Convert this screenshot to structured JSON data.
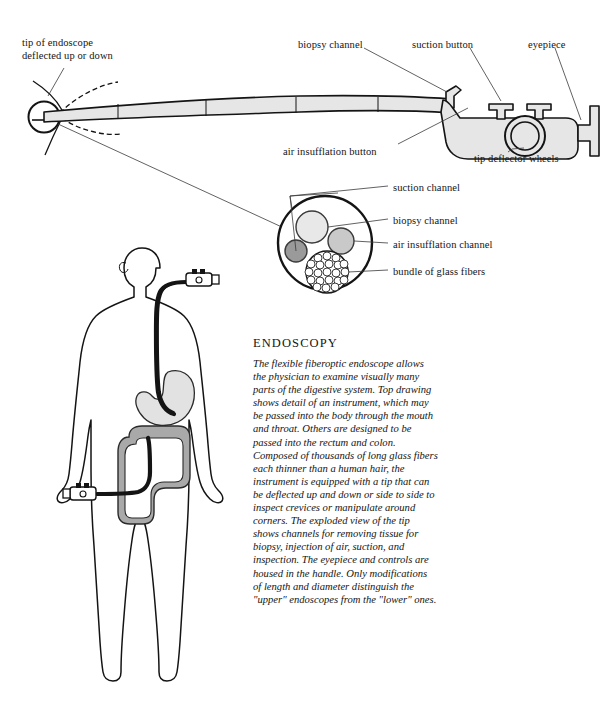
{
  "figure": {
    "title": "Endoscopy",
    "background_color": "#ffffff",
    "ink_color": "#141414"
  },
  "top_diagram": {
    "name": "flexible fiberoptic endoscope, side view",
    "labels": [
      {
        "id": "tip",
        "text": "tip of endoscope\ndeflected up or down",
        "x": 22,
        "y": 36
      },
      {
        "id": "biopsy_channel",
        "text": "biopsy channel",
        "x": 298,
        "y": 38
      },
      {
        "id": "suction_button",
        "text": "suction button",
        "x": 412,
        "y": 38
      },
      {
        "id": "eyepiece",
        "text": "eyepiece",
        "x": 528,
        "y": 38
      },
      {
        "id": "air_button",
        "text": "air insufflation button",
        "x": 283,
        "y": 145
      },
      {
        "id": "deflector_wheels",
        "text": "tip deflector wheels",
        "x": 474,
        "y": 152
      }
    ]
  },
  "cross_section": {
    "name": "exploded cross-section of endoscope tip",
    "labels": [
      {
        "id": "suction_channel",
        "text": "suction channel",
        "x": 393,
        "y": 181
      },
      {
        "id": "biopsy_channel",
        "text": "biopsy channel",
        "x": 393,
        "y": 214
      },
      {
        "id": "air_channel",
        "text": "air insufflation channel",
        "x": 393,
        "y": 238
      },
      {
        "id": "glass_fibers",
        "text": "bundle of glass fibers",
        "x": 393,
        "y": 265
      }
    ],
    "colors": {
      "biopsy_channel": "#e8e8e8",
      "air_insufflation_channel": "#c9c9c9",
      "suction_channel": "#9a9a9a",
      "fiber_bundle": "#ffffff"
    }
  },
  "body_figure": {
    "name": "human silhouette with upper and lower endoscopes",
    "organs": {
      "stomach_color": "#e2e2e2",
      "colon_color": "#a9a9a9"
    }
  },
  "panel": {
    "title": "ENDOSCOPY",
    "body": "The flexible fiberoptic endoscope allows the physician to examine visually many parts of the digestive system. Top drawing shows detail of an instrument, which may be passed into the body through the mouth and throat. Others are designed to be passed into the rectum and colon. Composed of thousands of long glass fibers each thinner than a human hair, the instrument is equipped with a tip that can be deflected up and down or side to side to inspect crevices or manipulate around corners. The exploded view of the tip shows channels for removing tissue for biopsy, injection of air, suction, and inspection. The eyepiece and controls are housed in the handle. Only modifications of length and diameter distinguish the \"upper\" endoscopes from the \"lower\" ones."
  }
}
